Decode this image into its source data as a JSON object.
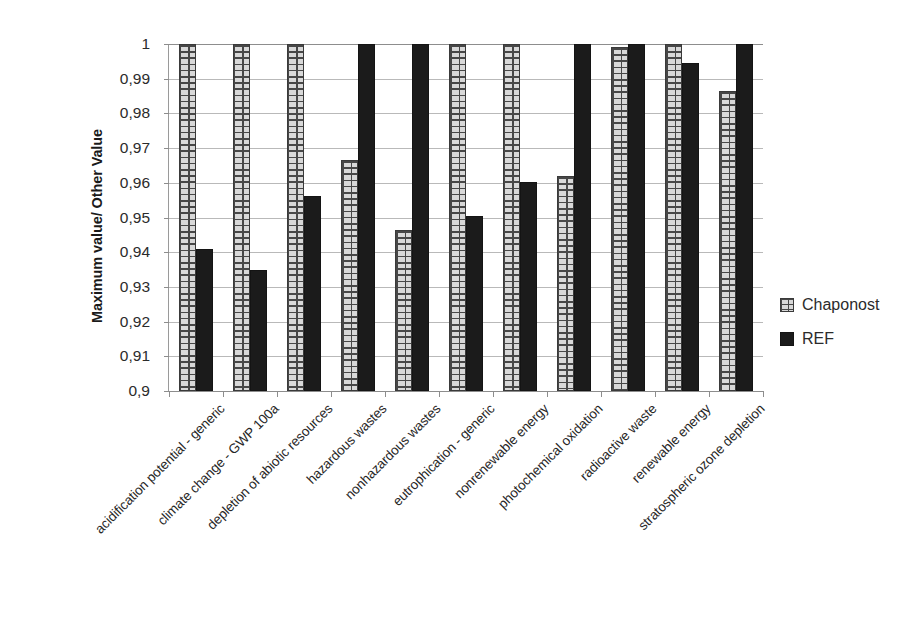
{
  "chart_data": {
    "type": "bar",
    "title": "",
    "xlabel": "",
    "ylabel": "Maximum value/ Other Value",
    "ylim": [
      0.9,
      1.0
    ],
    "ytick_labels": [
      "1",
      "0,99",
      "0,98",
      "0,97",
      "0,96",
      "0,95",
      "0,94",
      "0,93",
      "0,92",
      "0,91",
      "0,9"
    ],
    "ytick_values": [
      1.0,
      0.99,
      0.98,
      0.97,
      0.96,
      0.95,
      0.94,
      0.93,
      0.92,
      0.91,
      0.9
    ],
    "grid": true,
    "legend_position": "right",
    "categories": [
      "acidification potential - generic",
      "climate change - GWP 100a",
      "depletion of abiotic resources",
      "hazardous wastes",
      "nonhazardous wastes",
      "eutrophication - generic",
      "nonrenewable energy",
      "photochemical oxidation",
      "radioactive waste",
      "renewable energy",
      "stratospheric ozone depletion"
    ],
    "series": [
      {
        "name": "Chaponost",
        "pattern": "brick-hatch",
        "color": "#d8d8d8",
        "values": [
          1.0,
          1.0,
          1.0,
          0.9665,
          0.9465,
          1.0,
          1.0,
          0.962,
          0.999,
          1.0,
          0.9865
        ]
      },
      {
        "name": "REF",
        "pattern": "solid",
        "color": "#1b1b1b",
        "values": [
          0.9408,
          0.9348,
          0.9562,
          1.0,
          1.0,
          0.9505,
          0.9602,
          1.0,
          1.0,
          0.9945,
          1.0
        ]
      }
    ]
  },
  "legend": {
    "items": [
      {
        "label": "Chaponost"
      },
      {
        "label": "REF"
      }
    ]
  }
}
